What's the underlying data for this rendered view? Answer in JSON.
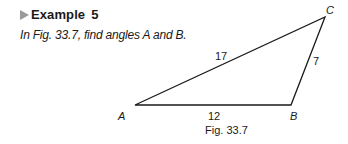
{
  "example": {
    "label": "Example",
    "number": "5",
    "question": "In Fig. 33.7, find angles A and B."
  },
  "figure": {
    "caption": "Fig. 33.7",
    "vertices": {
      "A": "A",
      "B": "B",
      "C": "C"
    },
    "sides": {
      "AC": "17",
      "AB": "12",
      "BC": "7"
    },
    "colors": {
      "stroke": "#1a1a1a",
      "marker": "#9a9a9a"
    }
  }
}
